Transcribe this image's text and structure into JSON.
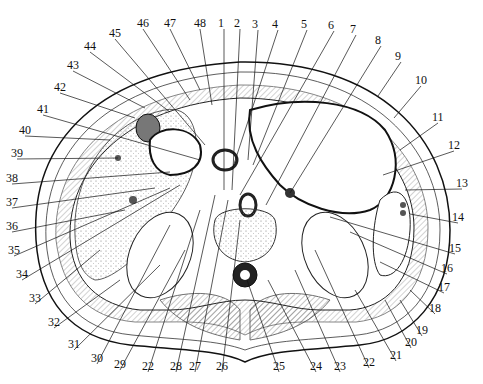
{
  "figure": {
    "labels": [
      {
        "n": "1",
        "x": 224,
        "y": 23,
        "lx": 224,
        "ly": 190
      },
      {
        "n": "2",
        "x": 240,
        "y": 23,
        "lx": 232,
        "ly": 190
      },
      {
        "n": "3",
        "x": 258,
        "y": 24,
        "lx": 248,
        "ly": 160
      },
      {
        "n": "4",
        "x": 278,
        "y": 24,
        "lx": 232,
        "ly": 170
      },
      {
        "n": "5",
        "x": 307,
        "y": 24,
        "lx": 253,
        "ly": 165
      },
      {
        "n": "6",
        "x": 334,
        "y": 25,
        "lx": 240,
        "ly": 195
      },
      {
        "n": "7",
        "x": 356,
        "y": 29,
        "lx": 266,
        "ly": 205
      },
      {
        "n": "8",
        "x": 381,
        "y": 40,
        "lx": 290,
        "ly": 193
      },
      {
        "n": "9",
        "x": 401,
        "y": 56,
        "lx": 378,
        "ly": 96
      },
      {
        "n": "10",
        "x": 421,
        "y": 80,
        "lx": 394,
        "ly": 118
      },
      {
        "n": "11",
        "x": 438,
        "y": 117,
        "lx": 400,
        "ly": 150
      },
      {
        "n": "12",
        "x": 454,
        "y": 145,
        "lx": 383,
        "ly": 175
      },
      {
        "n": "13",
        "x": 462,
        "y": 183,
        "lx": 405,
        "ly": 190
      },
      {
        "n": "14",
        "x": 458,
        "y": 217,
        "lx": 410,
        "ly": 214
      },
      {
        "n": "15",
        "x": 455,
        "y": 248,
        "lx": 330,
        "ly": 217
      },
      {
        "n": "16",
        "x": 447,
        "y": 268,
        "lx": 350,
        "ly": 232
      },
      {
        "n": "17",
        "x": 444,
        "y": 287,
        "lx": 380,
        "ly": 262
      },
      {
        "n": "18",
        "x": 435,
        "y": 308,
        "lx": 410,
        "ly": 290
      },
      {
        "n": "19",
        "x": 422,
        "y": 330,
        "lx": 400,
        "ly": 300
      },
      {
        "n": "20",
        "x": 411,
        "y": 342,
        "lx": 385,
        "ly": 300
      },
      {
        "n": "21",
        "x": 396,
        "y": 355,
        "lx": 355,
        "ly": 290
      },
      {
        "n": "22",
        "x": 369,
        "y": 362,
        "lx": 315,
        "ly": 250
      },
      {
        "n": "23",
        "x": 340,
        "y": 366,
        "lx": 295,
        "ly": 270
      },
      {
        "n": "24",
        "x": 316,
        "y": 366,
        "lx": 268,
        "ly": 280
      },
      {
        "n": "25",
        "x": 279,
        "y": 366,
        "lx": 247,
        "ly": 280
      },
      {
        "n": "26",
        "x": 222,
        "y": 366,
        "lx": 240,
        "ly": 220
      },
      {
        "n": "27",
        "x": 195,
        "y": 366,
        "lx": 228,
        "ly": 200
      },
      {
        "n": "28",
        "x": 176,
        "y": 366,
        "lx": 215,
        "ly": 195
      },
      {
        "n": "22b",
        "text": "22",
        "x": 148,
        "y": 366,
        "lx": 200,
        "ly": 210
      },
      {
        "n": "29",
        "x": 120,
        "y": 364,
        "lx": 185,
        "ly": 250
      },
      {
        "n": "30",
        "x": 97,
        "y": 358,
        "lx": 170,
        "ly": 225
      },
      {
        "n": "31",
        "x": 74,
        "y": 344,
        "lx": 160,
        "ly": 265
      },
      {
        "n": "32",
        "x": 54,
        "y": 322,
        "lx": 120,
        "ly": 280
      },
      {
        "n": "33",
        "x": 35,
        "y": 298,
        "lx": 100,
        "ly": 250
      },
      {
        "n": "34",
        "x": 22,
        "y": 274,
        "lx": 180,
        "ly": 185
      },
      {
        "n": "35",
        "x": 14,
        "y": 250,
        "lx": 170,
        "ly": 188
      },
      {
        "n": "36",
        "x": 12,
        "y": 226,
        "lx": 125,
        "ly": 210
      },
      {
        "n": "37",
        "x": 12,
        "y": 202,
        "lx": 155,
        "ly": 188
      },
      {
        "n": "38",
        "x": 12,
        "y": 178,
        "lx": 170,
        "ly": 172
      },
      {
        "n": "39",
        "x": 17,
        "y": 153,
        "lx": 118,
        "ly": 158
      },
      {
        "n": "40",
        "x": 25,
        "y": 130,
        "lx": 110,
        "ly": 140
      },
      {
        "n": "41",
        "x": 43,
        "y": 109,
        "lx": 200,
        "ly": 160
      },
      {
        "n": "42",
        "x": 60,
        "y": 87,
        "lx": 135,
        "ly": 118
      },
      {
        "n": "43",
        "x": 73,
        "y": 65,
        "lx": 145,
        "ly": 108
      },
      {
        "n": "44",
        "x": 90,
        "y": 46,
        "lx": 170,
        "ly": 112
      },
      {
        "n": "45",
        "x": 115,
        "y": 33,
        "lx": 205,
        "ly": 145
      },
      {
        "n": "46",
        "x": 143,
        "y": 23,
        "lx": 190,
        "ly": 100
      },
      {
        "n": "47",
        "x": 170,
        "y": 23,
        "lx": 200,
        "ly": 90
      },
      {
        "n": "48",
        "x": 200,
        "y": 23,
        "lx": 212,
        "ly": 105
      }
    ]
  }
}
